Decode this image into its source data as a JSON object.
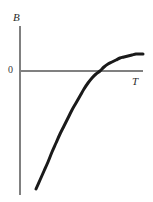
{
  "figure": {
    "name": "second-virial-coefficient-vs-temperature",
    "background_color": "#ffffff",
    "width": 153,
    "height": 202
  },
  "labels": {
    "y_axis": "B",
    "x_axis": "T",
    "origin_tick": "0"
  },
  "colors": {
    "axis": "#808080",
    "curve": "#1a1a1a",
    "text": "#2b2b2b",
    "background": "#ffffff"
  },
  "chart_data": {
    "type": "line",
    "title": "",
    "subtitle": "",
    "xlabel": "T",
    "ylabel": "B",
    "grid": false,
    "legend": null,
    "tick_labels": {
      "y": [
        "0"
      ],
      "x": []
    },
    "axis_geometry": {
      "y_axis_x": 20,
      "y_axis_top": 26,
      "y_axis_bottom": 195,
      "x_axis_y": 71,
      "x_axis_left": 20,
      "x_axis_right": 143
    },
    "annotations": [
      {
        "text": "0",
        "kind": "y-tick",
        "value": 0
      },
      {
        "text": "B",
        "kind": "axis-title",
        "axis": "y"
      },
      {
        "text": "T",
        "kind": "axis-title",
        "axis": "x"
      }
    ],
    "xlim": [
      20,
      143
    ],
    "ylim": [
      195,
      26
    ],
    "zero_crossing": {
      "x": 100,
      "y": 71
    },
    "asymptote_y": 54,
    "series": [
      {
        "name": "B(T)",
        "color": "#1a1a1a",
        "width": 3,
        "points": [
          [
            36,
            189
          ],
          [
            40,
            180
          ],
          [
            44,
            171
          ],
          [
            48,
            162
          ],
          [
            52,
            152
          ],
          [
            56,
            143
          ],
          [
            60,
            134
          ],
          [
            64,
            126
          ],
          [
            68,
            118
          ],
          [
            72,
            110
          ],
          [
            76,
            103
          ],
          [
            80,
            96
          ],
          [
            84,
            89
          ],
          [
            88,
            83
          ],
          [
            92,
            78
          ],
          [
            96,
            74
          ],
          [
            100,
            71
          ],
          [
            104,
            67
          ],
          [
            108,
            64
          ],
          [
            112,
            62
          ],
          [
            116,
            60
          ],
          [
            120,
            58
          ],
          [
            124,
            57
          ],
          [
            128,
            56
          ],
          [
            132,
            55
          ],
          [
            136,
            54
          ],
          [
            140,
            54
          ],
          [
            143,
            54
          ]
        ]
      }
    ]
  }
}
